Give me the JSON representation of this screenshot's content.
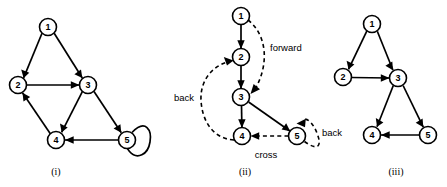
{
  "figure": {
    "background_color": "#ffffff",
    "ink_color": "#000000",
    "panels": [
      {
        "id": "panel-i",
        "caption": "(i)",
        "caption_x": 56,
        "caption_y": 172,
        "description": "Directed graph with solid edges and a self-loop at node 5",
        "nodes": [
          {
            "id": "1",
            "label": "1",
            "cx": 48,
            "cy": 27,
            "r": 8.5
          },
          {
            "id": "2",
            "label": "2",
            "cx": 18,
            "cy": 85,
            "r": 8.5
          },
          {
            "id": "3",
            "label": "3",
            "cx": 88,
            "cy": 85,
            "r": 8.5
          },
          {
            "id": "4",
            "label": "4",
            "cx": 56,
            "cy": 140,
            "r": 8.5
          },
          {
            "id": "5",
            "label": "5",
            "cx": 127,
            "cy": 140,
            "r": 8.5
          }
        ],
        "edges": [
          {
            "from": "1",
            "to": "2",
            "style": "solid",
            "kind": "tree"
          },
          {
            "from": "1",
            "to": "3",
            "style": "solid",
            "kind": "tree"
          },
          {
            "from": "2",
            "to": "3",
            "style": "solid",
            "kind": "tree"
          },
          {
            "from": "3",
            "to": "4",
            "style": "solid",
            "kind": "tree"
          },
          {
            "from": "3",
            "to": "5",
            "style": "solid",
            "kind": "tree"
          },
          {
            "from": "4",
            "to": "2",
            "style": "solid",
            "kind": "back"
          },
          {
            "from": "5",
            "to": "4",
            "style": "solid",
            "kind": "cross"
          },
          {
            "from": "5",
            "to": "5",
            "style": "solid",
            "kind": "self-loop"
          }
        ]
      },
      {
        "id": "panel-ii",
        "caption": "(ii)",
        "caption_x": 245,
        "caption_y": 172,
        "description": "Depth-first spanning tree with dashed non-tree edges labeled forward, back and cross",
        "nodes": [
          {
            "id": "1",
            "label": "1",
            "cx": 241,
            "cy": 16,
            "r": 8.5
          },
          {
            "id": "2",
            "label": "2",
            "cx": 241,
            "cy": 57,
            "r": 8.5
          },
          {
            "id": "3",
            "label": "3",
            "cx": 241,
            "cy": 97,
            "r": 8.5
          },
          {
            "id": "4",
            "label": "4",
            "cx": 242,
            "cy": 136,
            "r": 8.5
          },
          {
            "id": "5",
            "label": "5",
            "cx": 297,
            "cy": 136,
            "r": 8.5
          }
        ],
        "edges": [
          {
            "from": "1",
            "to": "2",
            "style": "solid",
            "kind": "tree"
          },
          {
            "from": "2",
            "to": "3",
            "style": "solid",
            "kind": "tree"
          },
          {
            "from": "3",
            "to": "4",
            "style": "solid",
            "kind": "tree"
          },
          {
            "from": "3",
            "to": "5",
            "style": "solid",
            "kind": "tree"
          },
          {
            "from": "1",
            "to": "3",
            "style": "dashed",
            "kind": "forward"
          },
          {
            "from": "4",
            "to": "2",
            "style": "dashed",
            "kind": "back"
          },
          {
            "from": "5",
            "to": "4",
            "style": "dashed",
            "kind": "cross"
          },
          {
            "from": "5",
            "to": "5",
            "style": "dashed",
            "kind": "back"
          }
        ],
        "labels": [
          {
            "text": "forward",
            "x": 270,
            "y": 48,
            "anchor": "start",
            "for_edge": "1->3"
          },
          {
            "text": "back",
            "x": 194,
            "y": 98,
            "anchor": "end",
            "for_edge": "4->2"
          },
          {
            "text": "cross",
            "x": 266,
            "y": 155,
            "anchor": "middle",
            "for_edge": "5->4"
          },
          {
            "text": "back",
            "x": 322,
            "y": 133,
            "anchor": "start",
            "for_edge": "5->5"
          }
        ]
      },
      {
        "id": "panel-iii",
        "caption": "(iii)",
        "caption_x": 396,
        "caption_y": 172,
        "description": "Directed acyclic graph with only solid tree and cross edges",
        "nodes": [
          {
            "id": "1",
            "label": "1",
            "cx": 372,
            "cy": 24,
            "r": 8.5
          },
          {
            "id": "2",
            "label": "2",
            "cx": 343,
            "cy": 77,
            "r": 8.5
          },
          {
            "id": "3",
            "label": "3",
            "cx": 398,
            "cy": 78,
            "r": 8.5
          },
          {
            "id": "4",
            "label": "4",
            "cx": 372,
            "cy": 135,
            "r": 8.5
          },
          {
            "id": "5",
            "label": "5",
            "cx": 428,
            "cy": 135,
            "r": 8.5
          }
        ],
        "edges": [
          {
            "from": "1",
            "to": "2",
            "style": "solid",
            "kind": "tree"
          },
          {
            "from": "1",
            "to": "3",
            "style": "solid",
            "kind": "tree"
          },
          {
            "from": "2",
            "to": "3",
            "style": "solid",
            "kind": "tree"
          },
          {
            "from": "3",
            "to": "4",
            "style": "solid",
            "kind": "tree"
          },
          {
            "from": "3",
            "to": "5",
            "style": "solid",
            "kind": "tree"
          },
          {
            "from": "5",
            "to": "4",
            "style": "solid",
            "kind": "cross"
          }
        ]
      }
    ]
  }
}
